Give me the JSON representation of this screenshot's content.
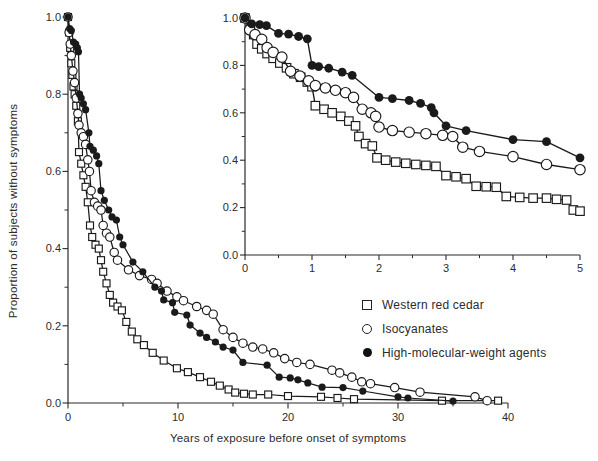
{
  "figure": {
    "background": "#ffffff",
    "line_color": "#1a1a1a",
    "axis_color": "#2b2b2b"
  },
  "legend": {
    "items": [
      {
        "label": "Western red cedar",
        "marker": "open-square"
      },
      {
        "label": "Isocyanates",
        "marker": "open-circle"
      },
      {
        "label": "High-molecular-weight agents",
        "marker": "filled-circle"
      }
    ]
  },
  "chart_data": [
    {
      "id": "main",
      "type": "line",
      "title": "",
      "xlabel": "Years of exposure before onset of symptoms",
      "ylabel": "Proportion of subjects without symptoms",
      "xlim": [
        0,
        40
      ],
      "ylim": [
        0,
        1
      ],
      "xticks": [
        0,
        10,
        20,
        30,
        40
      ],
      "xticklabels": [
        "0",
        "10",
        "20",
        "30",
        "40"
      ],
      "xminor": [
        5,
        15,
        25,
        35
      ],
      "yticks": [
        0,
        0.2,
        0.4,
        0.6,
        0.8,
        1.0
      ],
      "yticklabels": [
        "0.0",
        "0.2",
        "0.4",
        "0.6",
        "0.8",
        "1.0"
      ],
      "yminor": [
        0.1,
        0.3,
        0.5,
        0.7,
        0.9
      ],
      "grid": false,
      "legend_position": "below-inset",
      "series": [
        {
          "name": "Western red cedar",
          "marker": "open-square",
          "points": [
            [
              0,
              1.0
            ],
            [
              0.1,
              0.96
            ],
            [
              0.2,
              0.92
            ],
            [
              0.3,
              0.88
            ],
            [
              0.4,
              0.85
            ],
            [
              0.5,
              0.82
            ],
            [
              0.6,
              0.8
            ],
            [
              0.75,
              0.77
            ],
            [
              0.9,
              0.73
            ],
            [
              1.0,
              0.65
            ],
            [
              1.2,
              0.62
            ],
            [
              1.4,
              0.59
            ],
            [
              1.6,
              0.56
            ],
            [
              1.8,
              0.52
            ],
            [
              2.0,
              0.46
            ],
            [
              2.2,
              0.43
            ],
            [
              2.5,
              0.41
            ],
            [
              2.8,
              0.4
            ],
            [
              3.0,
              0.37
            ],
            [
              3.2,
              0.34
            ],
            [
              3.5,
              0.31
            ],
            [
              3.8,
              0.28
            ],
            [
              4.1,
              0.26
            ],
            [
              4.5,
              0.25
            ],
            [
              4.9,
              0.24
            ],
            [
              5.3,
              0.21
            ],
            [
              5.8,
              0.185
            ],
            [
              6.3,
              0.165
            ],
            [
              6.9,
              0.15
            ],
            [
              7.7,
              0.13
            ],
            [
              8.7,
              0.11
            ],
            [
              9.9,
              0.09
            ],
            [
              10.9,
              0.08
            ],
            [
              12.0,
              0.067
            ],
            [
              13.0,
              0.055
            ],
            [
              13.8,
              0.045
            ],
            [
              14.6,
              0.035
            ],
            [
              15.2,
              0.027
            ],
            [
              16.0,
              0.024
            ],
            [
              16.8,
              0.022
            ],
            [
              18.2,
              0.022
            ],
            [
              20.0,
              0.018
            ],
            [
              23.0,
              0.016
            ],
            [
              24.5,
              0.013
            ],
            [
              26.0,
              0.01
            ],
            [
              34.0,
              0.006
            ],
            [
              39.1,
              0.006
            ]
          ]
        },
        {
          "name": "Isocyanates",
          "marker": "open-circle",
          "points": [
            [
              0,
              1.0
            ],
            [
              0.1,
              0.96
            ],
            [
              0.2,
              0.93
            ],
            [
              0.3,
              0.9
            ],
            [
              0.45,
              0.86
            ],
            [
              0.6,
              0.83
            ],
            [
              0.75,
              0.79
            ],
            [
              0.9,
              0.75
            ],
            [
              1.0,
              0.72
            ],
            [
              1.2,
              0.7
            ],
            [
              1.4,
              0.69
            ],
            [
              1.6,
              0.67
            ],
            [
              1.8,
              0.63
            ],
            [
              1.95,
              0.6
            ],
            [
              2.1,
              0.55
            ],
            [
              2.4,
              0.52
            ],
            [
              2.7,
              0.51
            ],
            [
              3.0,
              0.5
            ],
            [
              3.2,
              0.46
            ],
            [
              3.5,
              0.44
            ],
            [
              3.8,
              0.43
            ],
            [
              4.2,
              0.39
            ],
            [
              4.5,
              0.37
            ],
            [
              5.5,
              0.345
            ],
            [
              6.5,
              0.33
            ],
            [
              7.6,
              0.32
            ],
            [
              8.1,
              0.31
            ],
            [
              9.0,
              0.29
            ],
            [
              9.9,
              0.275
            ],
            [
              10.5,
              0.265
            ],
            [
              11.7,
              0.25
            ],
            [
              12.6,
              0.24
            ],
            [
              13.2,
              0.23
            ],
            [
              14.1,
              0.19
            ],
            [
              15.0,
              0.17
            ],
            [
              15.9,
              0.155
            ],
            [
              16.8,
              0.145
            ],
            [
              17.7,
              0.14
            ],
            [
              18.7,
              0.13
            ],
            [
              19.7,
              0.115
            ],
            [
              20.8,
              0.105
            ],
            [
              22.0,
              0.1
            ],
            [
              24.0,
              0.085
            ],
            [
              24.7,
              0.078
            ],
            [
              25.8,
              0.067
            ],
            [
              26.7,
              0.055
            ],
            [
              27.5,
              0.05
            ],
            [
              29.7,
              0.04
            ],
            [
              32.0,
              0.028
            ],
            [
              37.0,
              0.016
            ],
            [
              38.1,
              0.006
            ]
          ]
        },
        {
          "name": "High-molecular-weight agents",
          "marker": "filled-circle",
          "points": [
            [
              0,
              1.0
            ],
            [
              0.15,
              0.97
            ],
            [
              0.3,
              0.965
            ],
            [
              0.5,
              0.935
            ],
            [
              0.7,
              0.93
            ],
            [
              0.85,
              0.92
            ],
            [
              0.95,
              0.91
            ],
            [
              1.05,
              0.8
            ],
            [
              1.2,
              0.79
            ],
            [
              1.4,
              0.775
            ],
            [
              1.6,
              0.76
            ],
            [
              1.9,
              0.7
            ],
            [
              2.0,
              0.665
            ],
            [
              2.3,
              0.655
            ],
            [
              2.6,
              0.64
            ],
            [
              2.8,
              0.62
            ],
            [
              3.0,
              0.55
            ],
            [
              3.3,
              0.525
            ],
            [
              3.7,
              0.5
            ],
            [
              4.0,
              0.482
            ],
            [
              4.4,
              0.474
            ],
            [
              4.7,
              0.43
            ],
            [
              5.0,
              0.41
            ],
            [
              5.9,
              0.365
            ],
            [
              6.8,
              0.34
            ],
            [
              7.9,
              0.3
            ],
            [
              8.5,
              0.29
            ],
            [
              8.7,
              0.267
            ],
            [
              9.5,
              0.26
            ],
            [
              9.7,
              0.235
            ],
            [
              10.8,
              0.228
            ],
            [
              11.1,
              0.202
            ],
            [
              12.0,
              0.181
            ],
            [
              12.6,
              0.17
            ],
            [
              13.4,
              0.158
            ],
            [
              14.1,
              0.145
            ],
            [
              15.0,
              0.137
            ],
            [
              15.9,
              0.105
            ],
            [
              18.1,
              0.098
            ],
            [
              19.2,
              0.067
            ],
            [
              20.2,
              0.065
            ],
            [
              20.9,
              0.06
            ],
            [
              21.8,
              0.052
            ],
            [
              23.1,
              0.041
            ],
            [
              25.0,
              0.04
            ],
            [
              26.8,
              0.031
            ],
            [
              30.0,
              0.016
            ],
            [
              30.9,
              0.013
            ],
            [
              35.0,
              0.005
            ]
          ]
        }
      ]
    },
    {
      "id": "inset",
      "type": "line",
      "title": "",
      "xlabel": "",
      "ylabel": "",
      "xlim": [
        0,
        5
      ],
      "ylim": [
        0,
        1
      ],
      "xticks": [
        0,
        1,
        2,
        3,
        4,
        5
      ],
      "xticklabels": [
        "0",
        "1",
        "2",
        "3",
        "4",
        "5"
      ],
      "xminor": [
        0.5,
        1.5,
        2.5,
        3.5,
        4.5
      ],
      "yticks": [
        0,
        0.2,
        0.4,
        0.6,
        0.8,
        1.0
      ],
      "yticklabels": [
        "0.0",
        "0.2",
        "0.4",
        "0.6",
        "0.8",
        "1.0"
      ],
      "yminor": [
        0.1,
        0.3,
        0.5,
        0.7,
        0.9
      ],
      "grid": false,
      "series": [
        {
          "name": "Western red cedar",
          "marker": "open-square",
          "points": [
            [
              0,
              1.0
            ],
            [
              0.08,
              0.96
            ],
            [
              0.13,
              0.93
            ],
            [
              0.18,
              0.89
            ],
            [
              0.25,
              0.87
            ],
            [
              0.33,
              0.85
            ],
            [
              0.42,
              0.83
            ],
            [
              0.52,
              0.81
            ],
            [
              0.62,
              0.79
            ],
            [
              0.73,
              0.765
            ],
            [
              0.83,
              0.75
            ],
            [
              0.93,
              0.73
            ],
            [
              1.0,
              0.71
            ],
            [
              1.05,
              0.63
            ],
            [
              1.18,
              0.615
            ],
            [
              1.3,
              0.6
            ],
            [
              1.43,
              0.585
            ],
            [
              1.55,
              0.565
            ],
            [
              1.65,
              0.545
            ],
            [
              1.7,
              0.5
            ],
            [
              1.8,
              0.47
            ],
            [
              1.9,
              0.46
            ],
            [
              1.97,
              0.41
            ],
            [
              2.1,
              0.4
            ],
            [
              2.25,
              0.392
            ],
            [
              2.4,
              0.387
            ],
            [
              2.55,
              0.382
            ],
            [
              2.7,
              0.378
            ],
            [
              2.85,
              0.374
            ],
            [
              3.0,
              0.335
            ],
            [
              3.15,
              0.33
            ],
            [
              3.3,
              0.322
            ],
            [
              3.45,
              0.29
            ],
            [
              3.6,
              0.288
            ],
            [
              3.75,
              0.286
            ],
            [
              3.9,
              0.247
            ],
            [
              4.1,
              0.243
            ],
            [
              4.3,
              0.24
            ],
            [
              4.5,
              0.24
            ],
            [
              4.65,
              0.235
            ],
            [
              4.8,
              0.232
            ],
            [
              4.9,
              0.19
            ],
            [
              5.0,
              0.185
            ]
          ]
        },
        {
          "name": "Isocyanates",
          "marker": "open-circle",
          "points": [
            [
              0,
              1.0
            ],
            [
              0.07,
              0.95
            ],
            [
              0.15,
              0.93
            ],
            [
              0.25,
              0.91
            ],
            [
              0.33,
              0.875
            ],
            [
              0.42,
              0.855
            ],
            [
              0.55,
              0.835
            ],
            [
              0.68,
              0.775
            ],
            [
              0.82,
              0.755
            ],
            [
              0.95,
              0.735
            ],
            [
              1.05,
              0.715
            ],
            [
              1.2,
              0.705
            ],
            [
              1.35,
              0.695
            ],
            [
              1.5,
              0.685
            ],
            [
              1.62,
              0.665
            ],
            [
              1.75,
              0.615
            ],
            [
              1.88,
              0.6
            ],
            [
              1.95,
              0.585
            ],
            [
              2.0,
              0.54
            ],
            [
              2.2,
              0.525
            ],
            [
              2.45,
              0.518
            ],
            [
              2.7,
              0.512
            ],
            [
              2.95,
              0.505
            ],
            [
              3.1,
              0.5
            ],
            [
              3.25,
              0.455
            ],
            [
              3.5,
              0.437
            ],
            [
              4.0,
              0.415
            ],
            [
              4.5,
              0.382
            ],
            [
              5.0,
              0.36
            ]
          ]
        },
        {
          "name": "High-molecular-weight agents",
          "marker": "filled-circle",
          "points": [
            [
              0,
              1.0
            ],
            [
              0.1,
              0.975
            ],
            [
              0.22,
              0.972
            ],
            [
              0.32,
              0.968
            ],
            [
              0.5,
              0.935
            ],
            [
              0.65,
              0.932
            ],
            [
              0.8,
              0.922
            ],
            [
              0.93,
              0.912
            ],
            [
              1.0,
              0.8
            ],
            [
              1.1,
              0.795
            ],
            [
              1.25,
              0.788
            ],
            [
              1.45,
              0.772
            ],
            [
              1.6,
              0.758
            ],
            [
              2.0,
              0.665
            ],
            [
              2.2,
              0.66
            ],
            [
              2.45,
              0.652
            ],
            [
              2.62,
              0.64
            ],
            [
              2.78,
              0.622
            ],
            [
              2.82,
              0.6
            ],
            [
              3.0,
              0.545
            ],
            [
              3.3,
              0.525
            ],
            [
              4.0,
              0.487
            ],
            [
              4.5,
              0.478
            ],
            [
              5.0,
              0.41
            ]
          ]
        }
      ]
    }
  ]
}
